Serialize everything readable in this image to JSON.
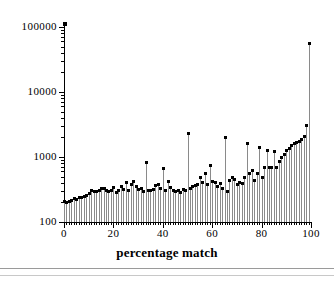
{
  "figure": {
    "background_color": "#ffffff",
    "stem_color": "#8a8a8a",
    "marker_color": "#000000",
    "axis_color": "#000000"
  },
  "axes": {
    "x_title": "percentage match",
    "y_title": "",
    "x_ticks": [
      "0",
      "20",
      "40",
      "60",
      "80",
      "100"
    ],
    "y_ticks": [
      "100",
      "1000",
      "10000",
      "100000"
    ]
  },
  "chart_data": {
    "type": "bar",
    "title": "",
    "xlabel": "percentage match",
    "ylabel": "",
    "yscale": "log",
    "ylim": [
      100,
      100000
    ],
    "xlim": [
      0,
      100
    ],
    "grid": false,
    "legend": null,
    "baseline": 100,
    "x": [
      0,
      1,
      2,
      3,
      4,
      5,
      6,
      7,
      8,
      9,
      10,
      11,
      12,
      13,
      14,
      15,
      16,
      17,
      18,
      19,
      20,
      21,
      22,
      23,
      24,
      25,
      26,
      27,
      28,
      29,
      30,
      31,
      32,
      33,
      34,
      35,
      36,
      37,
      38,
      39,
      40,
      41,
      42,
      43,
      44,
      45,
      46,
      47,
      48,
      49,
      50,
      51,
      52,
      53,
      54,
      55,
      56,
      57,
      58,
      59,
      60,
      61,
      62,
      63,
      64,
      65,
      66,
      67,
      68,
      69,
      70,
      71,
      72,
      73,
      74,
      75,
      76,
      77,
      78,
      79,
      80,
      81,
      82,
      83,
      84,
      85,
      86,
      87,
      88,
      89,
      90,
      91,
      92,
      93,
      94,
      95,
      96,
      97,
      98,
      99
    ],
    "values": [
      205,
      200,
      210,
      215,
      230,
      225,
      235,
      240,
      245,
      255,
      270,
      300,
      295,
      290,
      310,
      330,
      325,
      300,
      295,
      310,
      335,
      280,
      300,
      350,
      320,
      400,
      310,
      380,
      420,
      350,
      320,
      330,
      290,
      830,
      300,
      310,
      320,
      360,
      380,
      330,
      660,
      300,
      420,
      340,
      310,
      290,
      300,
      280,
      320,
      300,
      2300,
      330,
      350,
      360,
      380,
      480,
      400,
      550,
      380,
      750,
      420,
      400,
      350,
      390,
      330,
      2000,
      290,
      430,
      480,
      450,
      380,
      400,
      390,
      480,
      1600,
      560,
      620,
      430,
      560,
      1400,
      480,
      680,
      1250,
      700,
      680,
      1200,
      680,
      840,
      1000,
      1100,
      1250,
      1350,
      1500,
      1600,
      1700,
      1750,
      1850,
      2100,
      3000,
      55000
    ],
    "axis_top_marker": 100000
  }
}
